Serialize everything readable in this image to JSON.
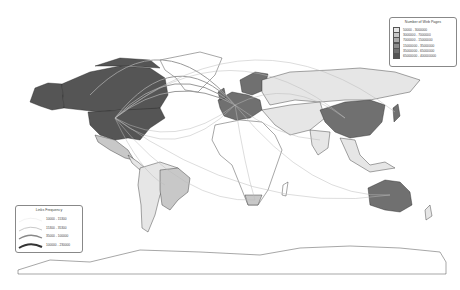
{
  "map": {
    "type": "flow-map",
    "projection": "world"
  },
  "legend_pages": {
    "title": "Number of Web Pages",
    "classes": [
      {
        "label": "50000 - 3000000",
        "color": "#e6e6e6"
      },
      {
        "label": "3000000 - 7000000",
        "color": "#c8c8c8"
      },
      {
        "label": "7000000 - 15000000",
        "color": "#aaaaaa"
      },
      {
        "label": "15000000 - 35000000",
        "color": "#8c8c8c"
      },
      {
        "label": "35000000 - 65000000",
        "color": "#707070"
      },
      {
        "label": "65000000 - 400000000",
        "color": "#555555"
      }
    ]
  },
  "legend_links": {
    "title": "Links Frequency",
    "classes": [
      {
        "label": "10000 - 15300",
        "color": "#dddddd"
      },
      {
        "label": "15300 - 35300",
        "color": "#bbbbbb"
      },
      {
        "label": "35000 - 100000",
        "color": "#888888"
      },
      {
        "label": "100000 - 230000",
        "color": "#333333"
      }
    ]
  },
  "regions": [
    {
      "name": "United States",
      "class": 5
    },
    {
      "name": "Canada",
      "class": 5
    },
    {
      "name": "Alaska",
      "class": 5
    },
    {
      "name": "Mexico",
      "class": 1
    },
    {
      "name": "Brazil",
      "class": 1
    },
    {
      "name": "South America",
      "class": 0
    },
    {
      "name": "Greenland",
      "class": -1
    },
    {
      "name": "Western Europe",
      "class": 4
    },
    {
      "name": "Scandinavia",
      "class": 4
    },
    {
      "name": "Russia",
      "class": 0
    },
    {
      "name": "China",
      "class": 4
    },
    {
      "name": "India",
      "class": 0
    },
    {
      "name": "Japan",
      "class": 4
    },
    {
      "name": "South Africa",
      "class": 1
    },
    {
      "name": "Australia",
      "class": 4
    },
    {
      "name": "Africa",
      "class": -1
    },
    {
      "name": "Middle East",
      "class": 0
    },
    {
      "name": "Southeast Asia",
      "class": 0
    },
    {
      "name": "Antarctica",
      "class": -1
    }
  ]
}
